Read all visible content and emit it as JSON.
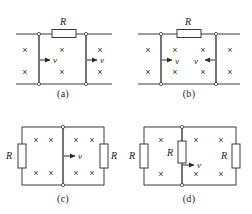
{
  "figure": {
    "background_color": "#ffffff",
    "line_color": "#3a3a3a",
    "text_color": "#1a1a1a",
    "field_symbol": "×",
    "field_symbol_name": "magnetic-field-into-page"
  },
  "panels": [
    {
      "id": "a",
      "caption": "(a)",
      "resistor_labels": [
        "R"
      ],
      "velocity_labels": [
        "v",
        "v"
      ],
      "arrow_directions": [
        "right",
        "right"
      ],
      "field_marks_rows": 2,
      "field_marks_cols": 3
    },
    {
      "id": "b",
      "caption": "(b)",
      "resistor_labels": [
        "R"
      ],
      "velocity_labels": [
        "v",
        "v"
      ],
      "arrow_directions": [
        "right",
        "left"
      ],
      "field_marks_rows": 2,
      "field_marks_cols": 4
    },
    {
      "id": "c",
      "caption": "(c)",
      "resistor_labels": [
        "R",
        "R"
      ],
      "velocity_labels": [
        "v"
      ],
      "arrow_directions": [
        "right"
      ],
      "field_marks_rows": 2,
      "field_marks_cols": 4
    },
    {
      "id": "d",
      "caption": "(d)",
      "resistor_labels": [
        "R",
        "R",
        "R"
      ],
      "velocity_labels": [
        "v"
      ],
      "arrow_directions": [
        "right"
      ],
      "field_marks_rows": 2,
      "field_marks_cols": 3
    }
  ],
  "labels": {
    "R": "R",
    "v": "v",
    "x": "×"
  }
}
